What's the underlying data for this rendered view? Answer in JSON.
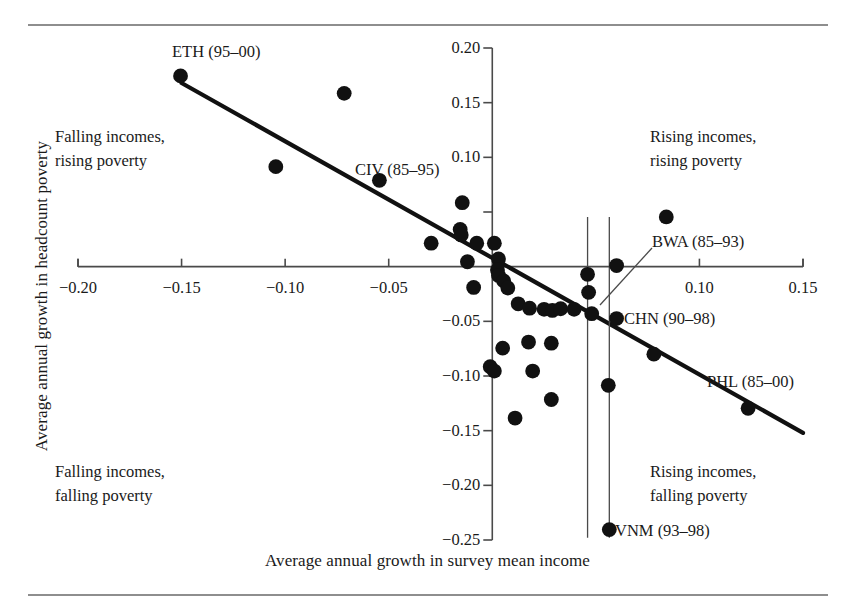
{
  "chart_data": {
    "type": "scatter",
    "title": "",
    "xlabel": "Average annual growth in survey mean income",
    "ylabel": "Average annual growth in headcount poverty",
    "xlim": [
      -0.2,
      0.15
    ],
    "ylim": [
      -0.25,
      0.2
    ],
    "grid": false,
    "legend": "none",
    "xticks": [
      -0.2,
      -0.15,
      -0.1,
      -0.05,
      0.1,
      0.15
    ],
    "xtick_labels": [
      "−0.20",
      "−0.15",
      "−0.10",
      "−0.05",
      "0.10",
      "0.15"
    ],
    "yticks": [
      0.2,
      0.15,
      0.1,
      0.05,
      -0.05,
      -0.1,
      -0.15,
      -0.2,
      -0.25
    ],
    "ytick_labels": [
      "0.20",
      "0.15",
      "0.10",
      "",
      "−0.05",
      "−0.10",
      "−0.15",
      "−0.20",
      "−0.25"
    ],
    "trendline": {
      "x": [
        -0.15,
        0.15
      ],
      "y": [
        0.168,
        -0.152
      ]
    },
    "points": [
      {
        "x": -0.1505,
        "y": 0.1745,
        "label": "ETH (95–00)"
      },
      {
        "x": -0.0715,
        "y": 0.1585,
        "label": ""
      },
      {
        "x": -0.1045,
        "y": 0.0915,
        "label": ""
      },
      {
        "x": -0.0545,
        "y": 0.079,
        "label": "CIV (85–95)"
      },
      {
        "x": -0.0145,
        "y": 0.0585,
        "label": ""
      },
      {
        "x": -0.0155,
        "y": 0.034,
        "label": ""
      },
      {
        "x": -0.015,
        "y": 0.029,
        "label": ""
      },
      {
        "x": -0.0295,
        "y": 0.0215,
        "label": ""
      },
      {
        "x": -0.0075,
        "y": 0.0215,
        "label": ""
      },
      {
        "x": 0.001,
        "y": 0.0215,
        "label": ""
      },
      {
        "x": 0.084,
        "y": 0.0455,
        "label": ""
      },
      {
        "x": -0.012,
        "y": 0.0045,
        "label": ""
      },
      {
        "x": 0.003,
        "y": 0.007,
        "label": ""
      },
      {
        "x": 0.0025,
        "y": -0.003,
        "label": ""
      },
      {
        "x": 0.003,
        "y": -0.008,
        "label": ""
      },
      {
        "x": 0.0055,
        "y": -0.013,
        "label": ""
      },
      {
        "x": 0.06,
        "y": 0.001,
        "label": "BWA (85–93)"
      },
      {
        "x": 0.046,
        "y": -0.007,
        "label": ""
      },
      {
        "x": -0.009,
        "y": -0.019,
        "label": ""
      },
      {
        "x": 0.0075,
        "y": -0.0195,
        "label": ""
      },
      {
        "x": 0.0465,
        "y": -0.0235,
        "label": ""
      },
      {
        "x": 0.0125,
        "y": -0.034,
        "label": ""
      },
      {
        "x": 0.018,
        "y": -0.038,
        "label": ""
      },
      {
        "x": 0.025,
        "y": -0.039,
        "label": ""
      },
      {
        "x": 0.029,
        "y": -0.04,
        "label": ""
      },
      {
        "x": 0.033,
        "y": -0.0385,
        "label": ""
      },
      {
        "x": 0.0395,
        "y": -0.039,
        "label": ""
      },
      {
        "x": 0.048,
        "y": -0.043,
        "label": ""
      },
      {
        "x": 0.06,
        "y": -0.0475,
        "label": "CHN (90–98)"
      },
      {
        "x": 0.0175,
        "y": -0.069,
        "label": ""
      },
      {
        "x": 0.0285,
        "y": -0.07,
        "label": ""
      },
      {
        "x": 0.005,
        "y": -0.0745,
        "label": ""
      },
      {
        "x": 0.078,
        "y": -0.08,
        "label": ""
      },
      {
        "x": -0.001,
        "y": -0.0915,
        "label": ""
      },
      {
        "x": 0.001,
        "y": -0.0955,
        "label": ""
      },
      {
        "x": 0.0195,
        "y": -0.0955,
        "label": ""
      },
      {
        "x": 0.056,
        "y": -0.1085,
        "label": ""
      },
      {
        "x": 0.1235,
        "y": -0.1295,
        "label": "PHL (85–00)"
      },
      {
        "x": 0.0285,
        "y": -0.1215,
        "label": ""
      },
      {
        "x": 0.011,
        "y": -0.1385,
        "label": ""
      },
      {
        "x": 0.0565,
        "y": -0.2405,
        "label": "VNM (93–98)"
      }
    ],
    "annotations": {
      "quadrant_top_left": "Falling incomes,\nrising poverty",
      "quadrant_top_right": "Rising incomes,\nrising poverty",
      "quadrant_bottom_left": "Falling incomes,\nfalling poverty",
      "quadrant_bottom_right": "Rising incomes,\nfalling poverty"
    },
    "point_labels": {
      "eth": "ETH (95–00)",
      "civ": "CIV (85–95)",
      "bwa": "BWA (85–93)",
      "chn": "CHN (90–98)",
      "phl": "PHL (85–00)",
      "vnm": "VNM (93–98)"
    },
    "colors": {
      "marker": "#111111",
      "trendline": "#111111",
      "axis": "#4a4a4a",
      "text": "#1a1a1a",
      "rule": "#8e8e8e",
      "background": "#ffffff"
    }
  }
}
